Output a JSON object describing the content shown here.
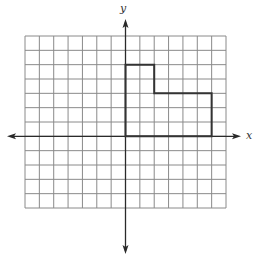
{
  "chart_data": {
    "type": "coordinate-grid",
    "title": "",
    "xlabel": "x",
    "ylabel": "y",
    "xlim": [
      -7,
      7
    ],
    "ylim": [
      -5,
      7
    ],
    "grid": true,
    "grid_step": 1,
    "tick_labels": false,
    "shapes": [
      {
        "name": "L-shaped polygon",
        "closed": true,
        "vertices": [
          [
            0,
            0
          ],
          [
            0,
            5
          ],
          [
            2,
            5
          ],
          [
            2,
            3
          ],
          [
            6,
            3
          ],
          [
            6,
            0
          ]
        ]
      }
    ]
  },
  "labels": {
    "x_axis": "x",
    "y_axis": "y"
  },
  "colors": {
    "grid": "#8a8a8a",
    "axis": "#2a2a2a",
    "shape": "#333333",
    "label": "#333333"
  }
}
